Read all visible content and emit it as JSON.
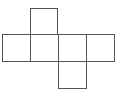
{
  "diagram": {
    "type": "cube-net",
    "stroke_color": "#555555",
    "background_color": "#ffffff",
    "faces": [
      {
        "id": "top",
        "x": 30,
        "y": 8,
        "w": 28,
        "h": 27
      },
      {
        "id": "row-1",
        "x": 2,
        "y": 34,
        "w": 29,
        "h": 28
      },
      {
        "id": "row-2",
        "x": 30,
        "y": 34,
        "w": 29,
        "h": 28
      },
      {
        "id": "row-3",
        "x": 58,
        "y": 34,
        "w": 29,
        "h": 28
      },
      {
        "id": "row-4",
        "x": 86,
        "y": 34,
        "w": 29,
        "h": 28
      },
      {
        "id": "bottom",
        "x": 58,
        "y": 61,
        "w": 29,
        "h": 28
      }
    ]
  }
}
